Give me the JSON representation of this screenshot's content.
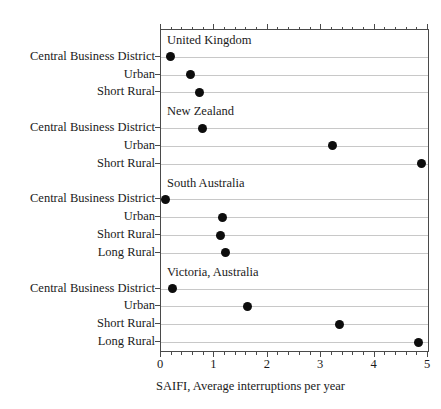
{
  "chart_data": {
    "type": "scatter",
    "title": "",
    "xlabel": "SAIFI, Average interruptions per year",
    "ylabel": "",
    "xlim": [
      0,
      5
    ],
    "xticks": [
      0,
      1,
      2,
      3,
      4,
      5
    ],
    "xticklabels": [
      "0",
      "1",
      "2",
      "3",
      "4",
      "5"
    ],
    "minor_ticks_per_interval": 5,
    "grid": "horizontal",
    "legend": "none",
    "marker": "filled-circle",
    "marker_color": "#0d0d0d",
    "groups": [
      {
        "name": "United Kingdom",
        "categories": [
          "Central Business District",
          "Urban",
          "Short Rural"
        ],
        "values": [
          0.17,
          0.55,
          0.73
        ]
      },
      {
        "name": "New Zealand",
        "categories": [
          "Central Business District",
          "Urban",
          "Short Rural"
        ],
        "values": [
          0.77,
          3.21,
          4.87
        ]
      },
      {
        "name": "South Australia",
        "categories": [
          "Central Business District",
          "Urban",
          "Short Rural",
          "Long Rural"
        ],
        "values": [
          0.08,
          1.16,
          1.12,
          1.2
        ]
      },
      {
        "name": "Victoria, Australia",
        "categories": [
          "Central Business District",
          "Urban",
          "Short Rural",
          "Long Rural"
        ],
        "values": [
          0.22,
          1.62,
          3.35,
          4.82
        ]
      }
    ]
  },
  "axis": {
    "x_title": "SAIFI, Average interruptions per year",
    "tick_labels": [
      "0",
      "1",
      "2",
      "3",
      "4",
      "5"
    ]
  },
  "groups": {
    "uk": {
      "title": "United Kingdom"
    },
    "nz": {
      "title": "New Zealand"
    },
    "sa": {
      "title": "South Australia"
    },
    "vic": {
      "title": "Victoria, Australia"
    }
  }
}
